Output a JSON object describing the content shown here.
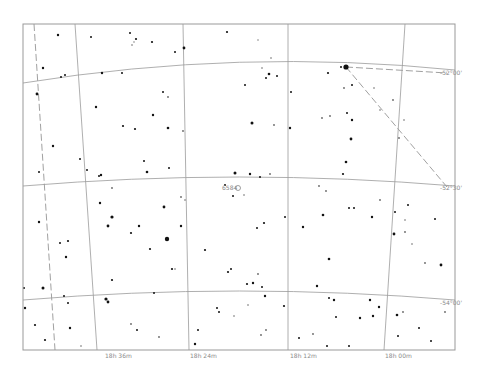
{
  "chart_data": {
    "type": "star-chart",
    "frame": {
      "x": 23,
      "y": 24,
      "width": 432,
      "height": 326
    },
    "colors": {
      "background": "#ffffff",
      "frame": "#999999",
      "grid": "#9a9a9a",
      "boundary": "#888888",
      "label": "#8a8a8a",
      "star": "#111111"
    },
    "ra_labels": [
      {
        "text": "18h 36m",
        "x": 105,
        "y": 358
      },
      {
        "text": "18h 24m",
        "x": 190,
        "y": 358
      },
      {
        "text": "18h 12m",
        "x": 290,
        "y": 358
      },
      {
        "text": "18h 00m",
        "x": 385,
        "y": 358
      }
    ],
    "dec_labels": [
      {
        "text": "-52°00'",
        "x": 440,
        "y": 75
      },
      {
        "text": "-52°30'",
        "x": 440,
        "y": 190
      },
      {
        "text": "-54°00'",
        "x": 440,
        "y": 305
      }
    ],
    "object_label": {
      "text": "6584",
      "x": 222,
      "y": 190,
      "name": "NGC 6584"
    },
    "ra_lines": [
      {
        "x1": 75,
        "y1": 24,
        "x2": 97,
        "y2": 350
      },
      {
        "x1": 183,
        "y1": 24,
        "x2": 189,
        "y2": 350
      },
      {
        "x1": 288,
        "y1": 24,
        "x2": 288,
        "y2": 350
      },
      {
        "x1": 405,
        "y1": 24,
        "x2": 384,
        "y2": 350
      }
    ],
    "dec_curves": [
      "M23,83 Q240,48 455,70",
      "M23,186 Q240,168 455,186",
      "M23,300 Q240,282 455,300"
    ],
    "boundary_lines": [
      "M34,24 L55,350",
      "M346,67 L447,73",
      "M346,67 L447,187"
    ],
    "stars": [
      [
        58,
        35,
        1.2
      ],
      [
        91,
        37,
        1
      ],
      [
        130,
        33,
        1
      ],
      [
        136,
        39,
        1.1
      ],
      [
        132,
        45,
        0.8
      ],
      [
        134,
        42,
        0.7
      ],
      [
        175,
        52,
        1
      ],
      [
        152,
        42,
        1.1
      ],
      [
        184,
        48,
        1.4
      ],
      [
        227,
        32,
        1.1
      ],
      [
        258,
        40,
        0.7
      ],
      [
        271,
        58,
        0.8
      ],
      [
        262,
        68,
        0.8
      ],
      [
        61,
        77,
        1
      ],
      [
        43,
        68,
        1.2
      ],
      [
        102,
        73,
        1.2
      ],
      [
        65,
        75,
        1
      ],
      [
        122,
        73,
        1
      ],
      [
        245,
        85,
        1
      ],
      [
        269,
        74,
        1.3
      ],
      [
        277,
        76,
        1
      ],
      [
        266,
        78,
        1
      ],
      [
        163,
        92,
        1
      ],
      [
        168,
        97,
        0.9
      ],
      [
        37,
        94,
        1.4
      ],
      [
        96,
        107,
        1.2
      ],
      [
        123,
        126,
        1.1
      ],
      [
        135,
        129,
        1.1
      ],
      [
        153,
        115,
        1.2
      ],
      [
        168,
        128,
        1.3
      ],
      [
        183,
        131,
        0.9
      ],
      [
        252,
        123,
        1.5
      ],
      [
        274,
        125,
        0.9
      ],
      [
        291,
        92,
        1
      ],
      [
        290,
        128,
        1.2
      ],
      [
        328,
        73,
        1.1
      ],
      [
        341,
        67,
        1
      ],
      [
        346,
        67,
        2.6
      ],
      [
        352,
        85,
        1
      ],
      [
        344,
        88,
        0.9
      ],
      [
        347,
        113,
        1
      ],
      [
        352,
        120,
        1.2
      ],
      [
        351,
        139,
        1.4
      ],
      [
        322,
        118,
        0.9
      ],
      [
        330,
        116,
        0.9
      ],
      [
        393,
        100,
        0.9
      ],
      [
        404,
        120,
        0.8
      ],
      [
        374,
        88,
        0.8
      ],
      [
        380,
        110,
        0.8
      ],
      [
        399,
        138,
        0.9
      ],
      [
        53,
        146,
        1.2
      ],
      [
        80,
        159,
        1
      ],
      [
        39,
        172,
        1
      ],
      [
        101,
        175,
        1.2
      ],
      [
        87,
        170,
        1
      ],
      [
        99,
        176,
        1
      ],
      [
        144,
        161,
        1
      ],
      [
        147,
        172,
        1.3
      ],
      [
        169,
        168,
        1
      ],
      [
        112,
        188,
        0.9
      ],
      [
        235,
        173,
        1.5
      ],
      [
        250,
        174,
        1.2
      ],
      [
        260,
        177,
        1
      ],
      [
        270,
        174,
        0.9
      ],
      [
        181,
        197,
        0.9
      ],
      [
        185,
        200,
        0.8
      ],
      [
        225,
        185,
        1
      ],
      [
        244,
        195,
        0.8
      ],
      [
        319,
        186,
        0.9
      ],
      [
        326,
        191,
        0.9
      ],
      [
        343,
        174,
        1.1
      ],
      [
        346,
        162,
        1.3
      ],
      [
        395,
        212,
        1
      ],
      [
        408,
        205,
        1
      ],
      [
        405,
        220,
        0.8
      ],
      [
        435,
        219,
        1
      ],
      [
        39,
        222,
        1.2
      ],
      [
        100,
        203,
        1.2
      ],
      [
        60,
        243,
        1
      ],
      [
        108,
        226,
        1.4
      ],
      [
        68,
        241,
        1.1
      ],
      [
        150,
        249,
        1.1
      ],
      [
        164,
        207,
        1.4
      ],
      [
        181,
        226,
        1.2
      ],
      [
        112,
        217,
        1.6
      ],
      [
        131,
        233,
        1.1
      ],
      [
        233,
        196,
        1
      ],
      [
        257,
        228,
        1
      ],
      [
        264,
        223,
        1.1
      ],
      [
        285,
        217,
        1
      ],
      [
        303,
        227,
        1.2
      ],
      [
        323,
        215,
        1.3
      ],
      [
        349,
        208,
        1
      ],
      [
        354,
        208,
        1
      ],
      [
        372,
        217,
        1.2
      ],
      [
        380,
        200,
        0.9
      ],
      [
        394,
        234,
        1.4
      ],
      [
        441,
        265,
        1.4
      ],
      [
        425,
        263,
        0.9
      ],
      [
        405,
        232,
        0.9
      ],
      [
        412,
        244,
        0.8
      ],
      [
        24,
        288,
        1
      ],
      [
        25,
        308,
        1.2
      ],
      [
        43,
        288,
        1.5
      ],
      [
        66,
        257,
        1.2
      ],
      [
        64,
        296,
        1
      ],
      [
        112,
        280,
        1.1
      ],
      [
        139,
        226,
        1.2
      ],
      [
        106,
        299,
        1.6
      ],
      [
        167,
        239,
        2.2
      ],
      [
        172,
        269,
        1.1
      ],
      [
        175,
        269,
        0.8
      ],
      [
        205,
        250,
        1.1
      ],
      [
        228,
        272,
        1.1
      ],
      [
        231,
        269,
        1
      ],
      [
        247,
        284,
        1.1
      ],
      [
        265,
        296,
        1.2
      ],
      [
        154,
        293,
        1
      ],
      [
        329,
        259,
        1.3
      ],
      [
        317,
        286,
        1.2
      ],
      [
        336,
        317,
        1
      ],
      [
        329,
        298,
        1
      ],
      [
        334,
        300,
        1.2
      ],
      [
        284,
        306,
        1.1
      ],
      [
        253,
        283,
        1.2
      ],
      [
        262,
        287,
        1
      ],
      [
        258,
        274,
        0.9
      ],
      [
        370,
        300,
        1.2
      ],
      [
        360,
        318,
        1.2
      ],
      [
        373,
        316,
        1.2
      ],
      [
        379,
        307,
        1.2
      ],
      [
        419,
        328,
        1
      ],
      [
        397,
        315,
        1.3
      ],
      [
        108,
        302,
        1.4
      ],
      [
        131,
        324,
        0.9
      ],
      [
        137,
        330,
        1
      ],
      [
        159,
        337,
        0.9
      ],
      [
        198,
        330,
        1
      ],
      [
        195,
        344,
        1.2
      ],
      [
        234,
        316,
        0.8
      ],
      [
        261,
        335,
        0.9
      ],
      [
        266,
        330,
        0.9
      ],
      [
        299,
        338,
        1
      ],
      [
        327,
        346,
        1
      ],
      [
        349,
        346,
        1
      ],
      [
        313,
        334,
        0.9
      ],
      [
        398,
        336,
        1
      ],
      [
        431,
        341,
        1
      ],
      [
        35,
        325,
        1.1
      ],
      [
        45,
        340,
        1.1
      ],
      [
        68,
        303,
        1
      ],
      [
        70,
        328,
        1.2
      ],
      [
        81,
        346,
        0.8
      ],
      [
        217,
        308,
        1
      ],
      [
        219,
        312,
        1
      ],
      [
        248,
        305,
        0.8
      ],
      [
        403,
        312,
        0.9
      ],
      [
        445,
        312,
        0.9
      ]
    ]
  }
}
